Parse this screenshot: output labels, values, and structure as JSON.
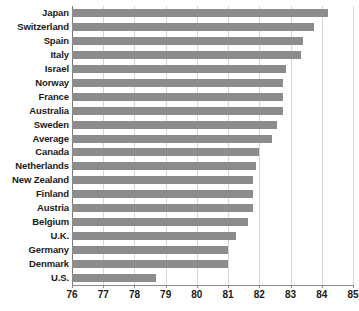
{
  "chart_data": {
    "type": "bar",
    "orientation": "horizontal",
    "title": "",
    "subtitle": "",
    "xlabel": "",
    "ylabel": "",
    "xlim": [
      76,
      85
    ],
    "ylim": null,
    "grid": true,
    "legend": null,
    "legend_position": "none",
    "xticks": [
      76,
      77,
      78,
      79,
      80,
      81,
      82,
      83,
      84,
      85
    ],
    "xtick_labels": [
      "76",
      "77",
      "78",
      "79",
      "80",
      "81",
      "82",
      "83",
      "84",
      "85"
    ],
    "categories": [
      "Japan",
      "Switzerland",
      "Spain",
      "Italy",
      "Israel",
      "Norway",
      "France",
      "Australia",
      "Sweden",
      "Average",
      "Canada",
      "Netherlands",
      "New Zealand",
      "Finland",
      "Austria",
      "Belgium",
      "U.K.",
      "Germany",
      "Denmark",
      "U.S."
    ],
    "values": [
      84.2,
      83.75,
      83.4,
      83.35,
      82.85,
      82.75,
      82.75,
      82.75,
      82.55,
      82.4,
      82.0,
      81.9,
      81.8,
      81.8,
      81.8,
      81.65,
      81.25,
      81.0,
      81.0,
      78.7
    ],
    "series": [
      {
        "name": "Life expectancy",
        "values": [
          84.2,
          83.75,
          83.4,
          83.35,
          82.85,
          82.75,
          82.75,
          82.75,
          82.55,
          82.4,
          82.0,
          81.9,
          81.8,
          81.8,
          81.8,
          81.65,
          81.25,
          81.0,
          81.0,
          78.7
        ]
      }
    ],
    "colors": {
      "bar": "#8c8c8c",
      "gridline": "#d6d6d6",
      "axis": "#8a8a8a",
      "text": "#1a1a1a",
      "background": "#ffffff"
    }
  }
}
